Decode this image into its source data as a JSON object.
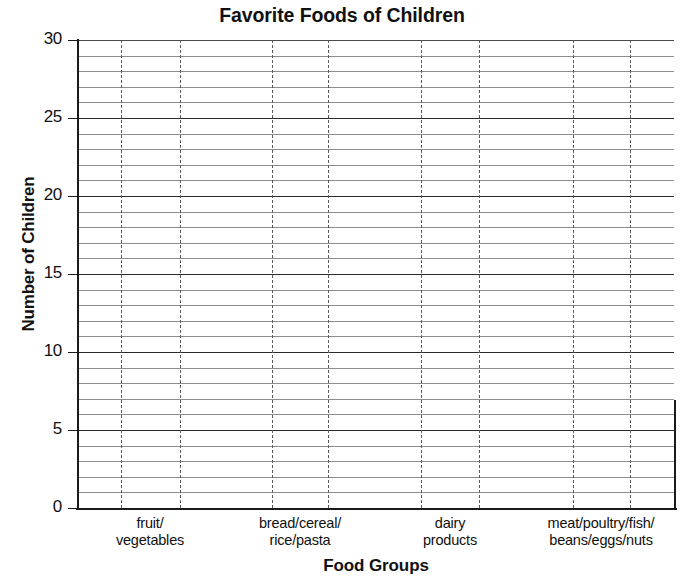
{
  "chart_data": {
    "type": "bar",
    "title": "Favorite Foods of Children",
    "xlabel": "Food Groups",
    "ylabel": "Number of Children",
    "categories": [
      "fruit/\nvegetables",
      "bread/cereal/\nrice/pasta",
      "dairy\nproducts",
      "meat/poultry/fish/\nbeans/eggs/nuts"
    ],
    "category_lines": [
      [
        "fruit/",
        "vegetables"
      ],
      [
        "bread/cereal/",
        "rice/pasta"
      ],
      [
        "dairy",
        "products"
      ],
      [
        "meat/poultry/fish/",
        "beans/eggs/nuts"
      ]
    ],
    "values": [
      0,
      0,
      0,
      0
    ],
    "ylim": [
      0,
      30
    ],
    "ytick_labels": [
      "0",
      "5",
      "10",
      "15",
      "20",
      "25",
      "30"
    ],
    "ytick_values": [
      0,
      5,
      10,
      15,
      20,
      25,
      30
    ],
    "y_major_step": 5,
    "y_minor_step": 1,
    "grid": "horizontal-minor-and-major, vertical-dashed-category-bands",
    "legend": "none",
    "note": "blank grid template - no bars plotted"
  },
  "axis_colors": {
    "axis": "#1a1a1a",
    "major_gridline": "#2b2b2b",
    "minor_gridline": "#8d8d8d",
    "vertical_dashed": "#5a5a5a",
    "text": "#111111",
    "background": "#ffffff"
  }
}
